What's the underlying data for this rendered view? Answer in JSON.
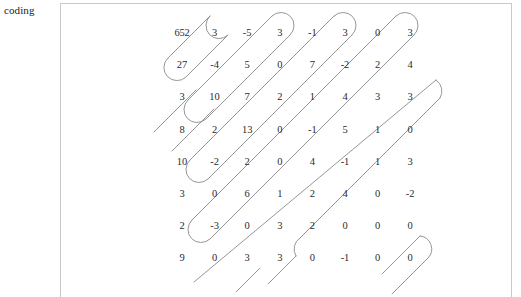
{
  "label": {
    "text": "coding"
  },
  "panel": {
    "border_color": "#c9c9c9",
    "background": "#ffffff"
  },
  "diagram": {
    "type": "snake-path-over-number-grid",
    "path_color": "#8a8a8a",
    "text_color": "#2b2b2b",
    "rows": 8,
    "cols": 8,
    "grid": [
      [
        "652",
        "3",
        "-5",
        "3",
        "-1",
        "3",
        "0",
        "3"
      ],
      [
        "27",
        "-4",
        "5",
        "0",
        "7",
        "-2",
        "2",
        "4"
      ],
      [
        "3",
        "10",
        "7",
        "2",
        "1",
        "4",
        "3",
        "3"
      ],
      [
        "8",
        "2",
        "13",
        "0",
        "-1",
        "5",
        "1",
        "0"
      ],
      [
        "10",
        "-2",
        "2",
        "0",
        "4",
        "-1",
        "1",
        "3"
      ],
      [
        "3",
        "0",
        "6",
        "1",
        "2",
        "4",
        "0",
        "-2"
      ],
      [
        "2",
        "-3",
        "0",
        "3",
        "2",
        "0",
        "0",
        "0"
      ],
      [
        "9",
        "0",
        "3",
        "3",
        "0",
        "-1",
        "0",
        "0"
      ]
    ]
  }
}
